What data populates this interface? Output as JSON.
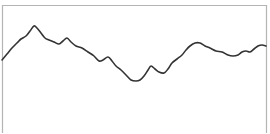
{
  "chart_data": {
    "type": "line",
    "title": "",
    "xlabel": "",
    "ylabel": "",
    "grid": false,
    "legend": null,
    "frame": {
      "left": 2.5,
      "top": 5.5,
      "right": 266.5,
      "bottom": 133,
      "border_color": "#b4b4b4",
      "sides": [
        "top",
        "left",
        "right"
      ]
    },
    "line_color": "#333333",
    "line_width": 1.6,
    "series": [
      {
        "name": "series-1",
        "points": [
          [
            2,
            60
          ],
          [
            7,
            54
          ],
          [
            12,
            48
          ],
          [
            17,
            43
          ],
          [
            21,
            39
          ],
          [
            26,
            36
          ],
          [
            30,
            31
          ],
          [
            34,
            26
          ],
          [
            37,
            28
          ],
          [
            41,
            33
          ],
          [
            45,
            38
          ],
          [
            49,
            40
          ],
          [
            54,
            42
          ],
          [
            59,
            44
          ],
          [
            63,
            41
          ],
          [
            67,
            38
          ],
          [
            71,
            42
          ],
          [
            76,
            46
          ],
          [
            82,
            48
          ],
          [
            88,
            52
          ],
          [
            94,
            56
          ],
          [
            99,
            61
          ],
          [
            103,
            60
          ],
          [
            108,
            57
          ],
          [
            112,
            61
          ],
          [
            116,
            66
          ],
          [
            121,
            70
          ],
          [
            126,
            75
          ],
          [
            131,
            80
          ],
          [
            136,
            81
          ],
          [
            140,
            80
          ],
          [
            144,
            76
          ],
          [
            148,
            70
          ],
          [
            151,
            66
          ],
          [
            155,
            69
          ],
          [
            159,
            72
          ],
          [
            164,
            73
          ],
          [
            168,
            69
          ],
          [
            172,
            63
          ],
          [
            177,
            59
          ],
          [
            182,
            55
          ],
          [
            186,
            50
          ],
          [
            190,
            46
          ],
          [
            195,
            43
          ],
          [
            200,
            43
          ],
          [
            205,
            46
          ],
          [
            210,
            48
          ],
          [
            216,
            51
          ],
          [
            222,
            52
          ],
          [
            228,
            55
          ],
          [
            233,
            56
          ],
          [
            238,
            55
          ],
          [
            242,
            52
          ],
          [
            246,
            51
          ],
          [
            250,
            52
          ],
          [
            254,
            49
          ],
          [
            258,
            46
          ],
          [
            262,
            45
          ],
          [
            266,
            46
          ]
        ]
      }
    ]
  }
}
